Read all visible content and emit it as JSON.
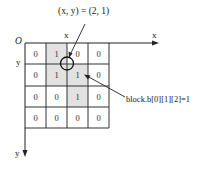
{
  "diagram": {
    "coordinate_label": "(x, y) = (2, 1)",
    "origin_label": "O",
    "x_axis_label": "x",
    "y_axis_label": "y",
    "x_column_marker": "x",
    "y_row_marker": "y",
    "annotation": "block.b[0][1][2]=1",
    "grid": [
      [
        "0",
        "1",
        "0",
        "0"
      ],
      [
        "0",
        "1",
        "1",
        "0"
      ],
      [
        "0",
        "0",
        "1",
        "0"
      ],
      [
        "0",
        "0",
        "0",
        "0"
      ]
    ],
    "shaded_cells": [
      [
        0,
        1
      ],
      [
        1,
        1
      ],
      [
        1,
        2
      ],
      [
        2,
        2
      ]
    ],
    "colors": {
      "shade": "#e2e2e2",
      "line": "#333333",
      "background": "#ffffff"
    }
  }
}
